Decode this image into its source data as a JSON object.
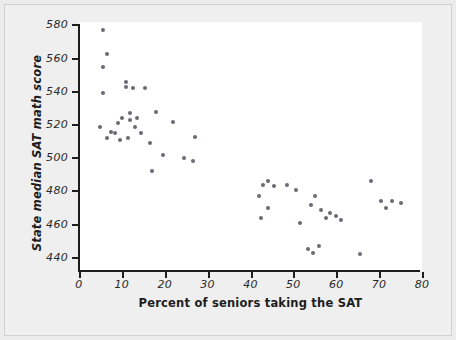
{
  "chart_data": {
    "type": "scatter",
    "title": "",
    "xlabel": "Percent of seniors taking the SAT",
    "ylabel": "State median SAT math score",
    "xlim": [
      0,
      80
    ],
    "ylim": [
      432,
      582
    ],
    "xticks": [
      0,
      10,
      20,
      30,
      40,
      50,
      60,
      70,
      80
    ],
    "yticks": [
      440,
      460,
      480,
      500,
      520,
      540,
      560,
      580
    ],
    "grid": false,
    "legend": null,
    "marker": {
      "shape": "circle",
      "color": "#6a6a73",
      "size": 4
    },
    "background": "#ffffff",
    "figure_background": "#ececec",
    "points": [
      {
        "x": 5.5,
        "y": 577
      },
      {
        "x": 6.5,
        "y": 563
      },
      {
        "x": 5.5,
        "y": 555
      },
      {
        "x": 11.0,
        "y": 546
      },
      {
        "x": 11.0,
        "y": 543
      },
      {
        "x": 5.5,
        "y": 539
      },
      {
        "x": 12.5,
        "y": 542
      },
      {
        "x": 15.5,
        "y": 542
      },
      {
        "x": 12.0,
        "y": 527
      },
      {
        "x": 12.0,
        "y": 523
      },
      {
        "x": 10.0,
        "y": 524
      },
      {
        "x": 9.0,
        "y": 521
      },
      {
        "x": 13.5,
        "y": 524
      },
      {
        "x": 5.0,
        "y": 519
      },
      {
        "x": 7.5,
        "y": 516
      },
      {
        "x": 8.5,
        "y": 515
      },
      {
        "x": 13.0,
        "y": 519
      },
      {
        "x": 14.5,
        "y": 515
      },
      {
        "x": 6.5,
        "y": 512
      },
      {
        "x": 9.5,
        "y": 511
      },
      {
        "x": 11.5,
        "y": 512
      },
      {
        "x": 18.0,
        "y": 528
      },
      {
        "x": 22.0,
        "y": 522
      },
      {
        "x": 27.0,
        "y": 513
      },
      {
        "x": 16.5,
        "y": 509
      },
      {
        "x": 19.5,
        "y": 502
      },
      {
        "x": 24.5,
        "y": 500
      },
      {
        "x": 26.5,
        "y": 498
      },
      {
        "x": 17.0,
        "y": 492
      },
      {
        "x": 43.0,
        "y": 484
      },
      {
        "x": 44.0,
        "y": 486
      },
      {
        "x": 45.5,
        "y": 483
      },
      {
        "x": 48.5,
        "y": 484
      },
      {
        "x": 50.5,
        "y": 481
      },
      {
        "x": 42.0,
        "y": 477
      },
      {
        "x": 44.0,
        "y": 470
      },
      {
        "x": 42.5,
        "y": 464
      },
      {
        "x": 55.0,
        "y": 477
      },
      {
        "x": 54.0,
        "y": 472
      },
      {
        "x": 56.5,
        "y": 469
      },
      {
        "x": 58.5,
        "y": 467
      },
      {
        "x": 57.5,
        "y": 464
      },
      {
        "x": 60.0,
        "y": 465
      },
      {
        "x": 51.5,
        "y": 461
      },
      {
        "x": 61.0,
        "y": 463
      },
      {
        "x": 68.0,
        "y": 486
      },
      {
        "x": 70.5,
        "y": 474
      },
      {
        "x": 73.0,
        "y": 474
      },
      {
        "x": 75.0,
        "y": 473
      },
      {
        "x": 71.5,
        "y": 470
      },
      {
        "x": 53.5,
        "y": 445
      },
      {
        "x": 54.5,
        "y": 443
      },
      {
        "x": 56.0,
        "y": 447
      },
      {
        "x": 65.5,
        "y": 442
      }
    ]
  }
}
